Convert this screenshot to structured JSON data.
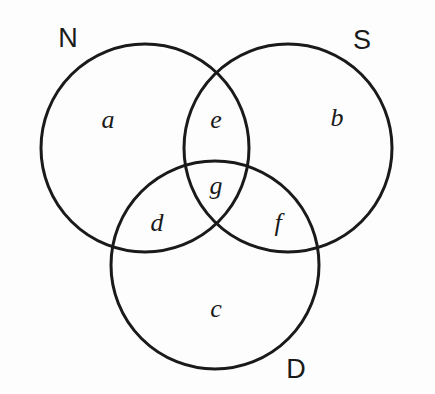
{
  "figure": {
    "type": "venn-diagram",
    "sets_count": 3,
    "background_color": "#fdfdfd",
    "stroke_color": "#1a1a1a",
    "stroke_width": 3,
    "width": 435,
    "height": 394
  },
  "circles": [
    {
      "id": "N",
      "cx": 145,
      "cy": 148,
      "r": 104
    },
    {
      "id": "S",
      "cx": 288,
      "cy": 148,
      "r": 104
    },
    {
      "id": "D",
      "cx": 215,
      "cy": 265,
      "r": 104
    }
  ],
  "set_labels": [
    {
      "name": "set-label-n",
      "text": "N",
      "x": 68,
      "y": 38
    },
    {
      "name": "set-label-s",
      "text": "S",
      "x": 362,
      "y": 40
    },
    {
      "name": "set-label-d",
      "text": "D",
      "x": 296,
      "y": 369
    }
  ],
  "region_labels": [
    {
      "name": "region-label-a",
      "text": "a",
      "x": 108,
      "y": 120,
      "region": "N only"
    },
    {
      "name": "region-label-b",
      "text": "b",
      "x": 337,
      "y": 118,
      "region": "S only"
    },
    {
      "name": "region-label-c",
      "text": "c",
      "x": 216,
      "y": 309,
      "region": "D only"
    },
    {
      "name": "region-label-d",
      "text": "d",
      "x": 157,
      "y": 223,
      "region": "N and D"
    },
    {
      "name": "region-label-e",
      "text": "e",
      "x": 216,
      "y": 120,
      "region": "N and S"
    },
    {
      "name": "region-label-f",
      "text": "f",
      "x": 278,
      "y": 223,
      "region": "S and D"
    },
    {
      "name": "region-label-g",
      "text": "g",
      "x": 216,
      "y": 186,
      "region": "N and S and D"
    }
  ]
}
